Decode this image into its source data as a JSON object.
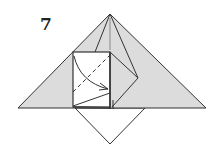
{
  "diagram": {
    "step_number": "7",
    "colors": {
      "paper_fill": "#dcdcdc",
      "white_fill": "#ffffff",
      "line": "#333333"
    }
  }
}
